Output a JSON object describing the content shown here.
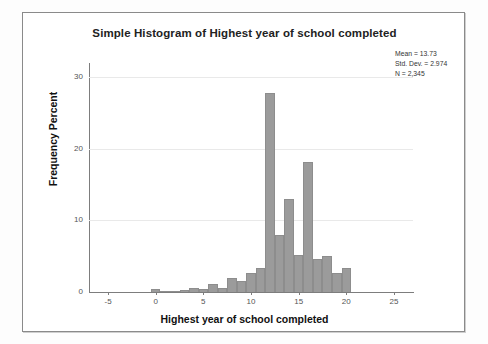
{
  "chart_data": {
    "type": "bar",
    "title": "Simple Histogram of Highest year of school completed",
    "xlabel": "Highest year of school completed",
    "ylabel": "Frequency Percent",
    "xlim": [
      -7,
      27
    ],
    "ylim": [
      0,
      32
    ],
    "xticks": [
      -5,
      0,
      5,
      10,
      15,
      20,
      25
    ],
    "yticks": [
      0,
      10,
      20,
      30
    ],
    "grid": true,
    "legend": "none",
    "bar_color": "#9b9b9b",
    "bin_width": 1,
    "categories": [
      0,
      1,
      2,
      3,
      4,
      5,
      6,
      7,
      8,
      9,
      10,
      11,
      12,
      13,
      14,
      15,
      16,
      17,
      18,
      19,
      20
    ],
    "values": [
      0.4,
      0.1,
      0.2,
      0.3,
      0.5,
      0.4,
      1.1,
      0.5,
      2.0,
      1.6,
      2.6,
      3.4,
      27.8,
      8.0,
      13.0,
      5.2,
      18.2,
      4.6,
      5.1,
      2.6,
      3.4
    ]
  },
  "stats": {
    "mean": "Mean = 13.73",
    "std_dev": "Std. Dev. = 2.974",
    "n": "N = 2,345"
  }
}
